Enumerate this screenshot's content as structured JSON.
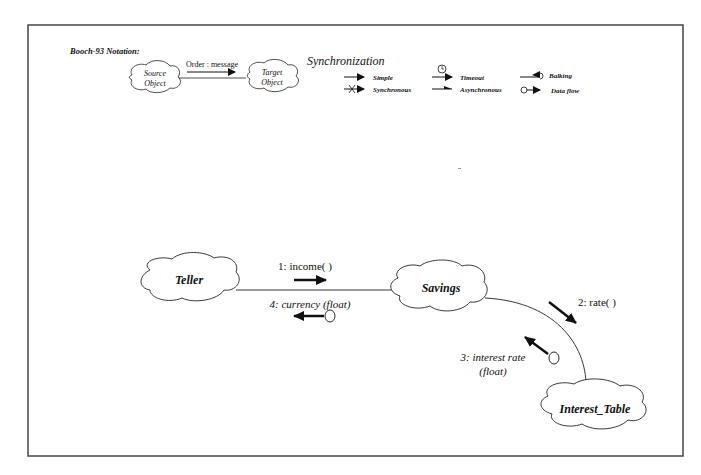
{
  "notation": {
    "title": "Booch-93 Notation:",
    "example": {
      "source": [
        "Source",
        "Object"
      ],
      "target": [
        "Target",
        "Object"
      ],
      "message": "Order : message"
    }
  },
  "synchronization": {
    "title": "Synchronization",
    "items": [
      {
        "icon": "simple-arrow-icon",
        "label": "Simple"
      },
      {
        "icon": "synchronous-arrow-icon",
        "label": "Synchronous"
      },
      {
        "icon": "timeout-arrow-icon",
        "label": "Timeout"
      },
      {
        "icon": "asynchronous-arrow-icon",
        "label": "Asynchronous"
      },
      {
        "icon": "balking-arrow-icon",
        "label": "Balking"
      },
      {
        "icon": "data-flow-icon",
        "label": "Data flow"
      }
    ]
  },
  "diagram": {
    "objects": {
      "teller": "Teller",
      "savings": "Savings",
      "interest_table": "Interest_Table"
    },
    "messages": [
      {
        "seq": "1: income( )",
        "from": "Teller",
        "to": "Savings",
        "kind": "simple"
      },
      {
        "seq": "2: rate( )",
        "from": "Savings",
        "to": "Interest_Table",
        "kind": "simple"
      },
      {
        "seq": "3: interest rate",
        "seq2": "(float)",
        "from": "Interest_Table",
        "to": "Savings",
        "kind": "data flow"
      },
      {
        "seq": "4:  currency (float)",
        "from": "Savings",
        "to": "Teller",
        "kind": "data flow"
      }
    ]
  },
  "colors": {
    "line": "#111111",
    "frame": "#444444",
    "background": "#ffffff"
  }
}
